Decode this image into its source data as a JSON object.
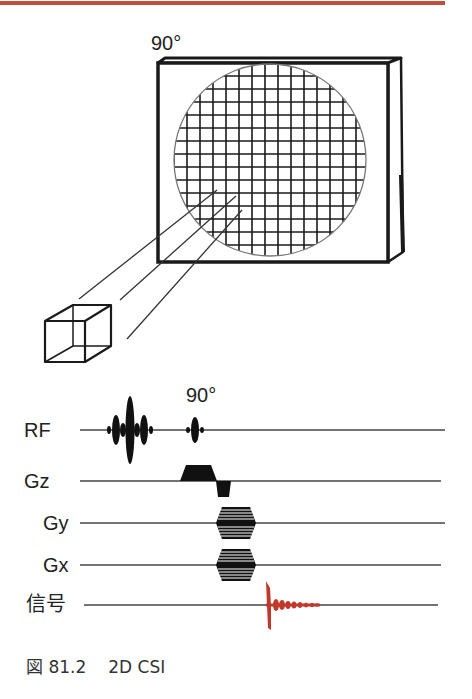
{
  "figure": {
    "slab_flip_label": "90°",
    "sequence_flip_label": "90°",
    "caption_prefix": "図 81.2",
    "caption_title": "2D CSI",
    "accent_color": "#c0503a",
    "signal_color": "#c0392b"
  },
  "pulse_sequence": {
    "rows": [
      {
        "label": "RF",
        "waveform": "sinc-selective-pulses-then-90deg-pulse"
      },
      {
        "label": "Gz",
        "waveform": "slice-select-trapezoid-with-rephase-lobe"
      },
      {
        "label": "Gy",
        "waveform": "phase-encode-table"
      },
      {
        "label": "Gx",
        "waveform": "phase-encode-table"
      },
      {
        "label": "信号",
        "waveform": "FID-decay"
      }
    ]
  },
  "illustration": {
    "slab": "3D slab with circular FOV",
    "grid": "phase-encoded voxel grid",
    "voxel": "single cube voxel with projection lines"
  }
}
